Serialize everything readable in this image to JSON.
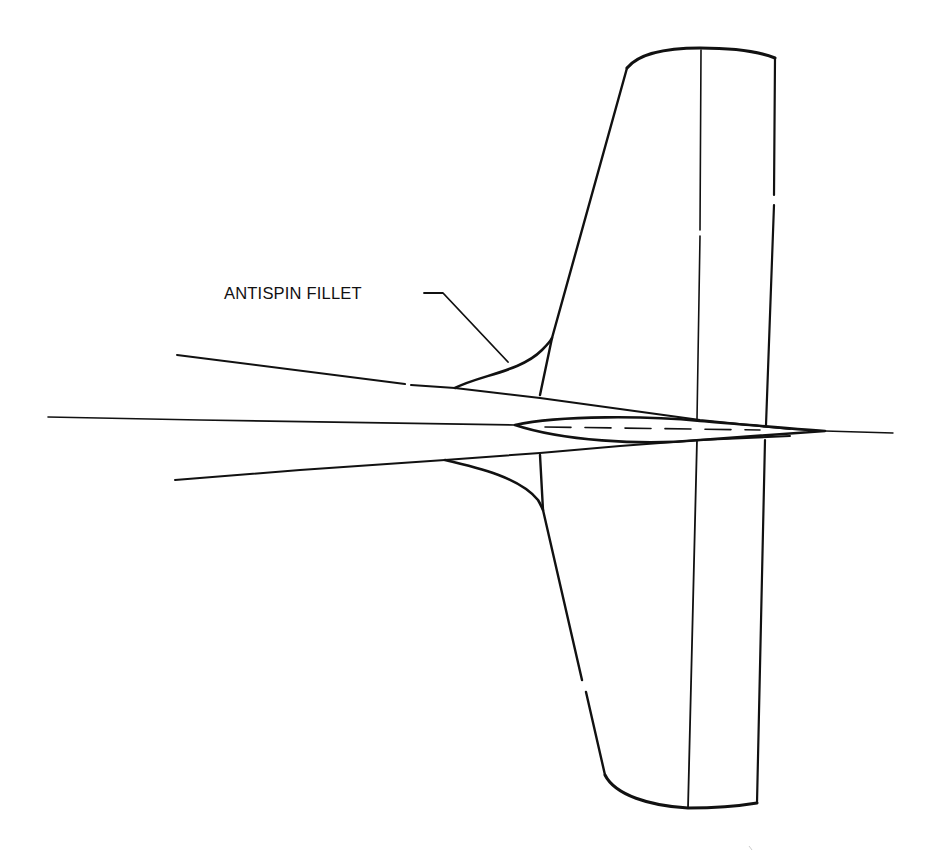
{
  "figure": {
    "type": "line-drawing",
    "annotations": [
      {
        "text": "ANTISPIN FILLET",
        "points_to": "upper-antispin-fillet"
      }
    ],
    "colors": {
      "background": "#ffffff",
      "ink": "#111111"
    }
  }
}
